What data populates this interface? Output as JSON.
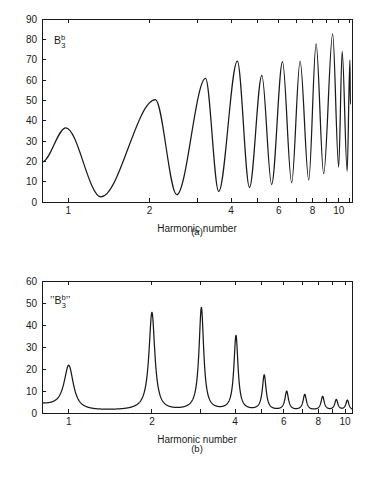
{
  "figure": {
    "background_color": "#ffffff",
    "ink_color": "#1a1a1a"
  },
  "chart_data": [
    {
      "type": "line",
      "panel": "a",
      "caption": "(a)",
      "title": "",
      "series_label": "B",
      "series_label_sup": "b",
      "series_label_sub": "3",
      "xlabel": "Harmonic number",
      "ylabel": "",
      "xscale": "log",
      "xlim": [
        0.8,
        11.2
      ],
      "ylim": [
        0,
        90
      ],
      "yticks": [
        0,
        10,
        20,
        30,
        40,
        50,
        60,
        70,
        80,
        90
      ],
      "xticks": [
        1,
        2,
        3,
        4,
        5,
        6,
        7,
        8,
        9,
        10,
        11
      ],
      "xticklabels": [
        "1",
        "2",
        "",
        "4",
        "",
        "6",
        "",
        "8",
        "",
        "10",
        ""
      ],
      "grid": false,
      "legend": "none",
      "line_color": "#1a1a1a",
      "peaks": [
        {
          "x": 0.98,
          "y": 36.5
        },
        {
          "x": 2.1,
          "y": 50.3
        },
        {
          "x": 3.22,
          "y": 60.8
        },
        {
          "x": 4.22,
          "y": 69.3
        },
        {
          "x": 5.2,
          "y": 62.3
        },
        {
          "x": 6.2,
          "y": 69.0
        },
        {
          "x": 7.2,
          "y": 69.3
        },
        {
          "x": 8.25,
          "y": 77.8
        },
        {
          "x": 9.5,
          "y": 82.7
        },
        {
          "x": 10.3,
          "y": 74.2
        },
        {
          "x": 11.0,
          "y": 69.8
        }
      ],
      "troughs": [
        {
          "x": 1.32,
          "y": 2.5
        },
        {
          "x": 2.52,
          "y": 3.6
        },
        {
          "x": 3.6,
          "y": 5.2
        },
        {
          "x": 4.68,
          "y": 7.1
        },
        {
          "x": 5.65,
          "y": 8.6
        },
        {
          "x": 6.7,
          "y": 9.4
        },
        {
          "x": 7.75,
          "y": 10.8
        },
        {
          "x": 8.8,
          "y": 13.9
        },
        {
          "x": 10.0,
          "y": 17.2
        },
        {
          "x": 10.75,
          "y": 15.1
        },
        {
          "x": 11.05,
          "y": 48.2
        }
      ],
      "start_point": {
        "x": 0.8,
        "y": 19.6
      }
    },
    {
      "type": "line",
      "panel": "b",
      "caption": "(b)",
      "title": "",
      "series_label": "B",
      "series_label_sup": "b",
      "series_label_sub": "3",
      "series_label_quoted": true,
      "xlabel": "Harmonic number",
      "ylabel": "",
      "xscale": "log",
      "xlim": [
        0.8,
        10.6
      ],
      "ylim": [
        0,
        60
      ],
      "yticks": [
        0,
        10,
        20,
        30,
        40,
        50,
        60
      ],
      "xticks": [
        1,
        2,
        3,
        4,
        5,
        6,
        7,
        8,
        9,
        10
      ],
      "xticklabels": [
        "1",
        "2",
        "",
        "4",
        "",
        "6",
        "",
        "8",
        "",
        "10"
      ],
      "grid": false,
      "legend": "none",
      "line_color": "#1a1a1a",
      "peaks": [
        {
          "x": 1.0,
          "y": 21.5
        },
        {
          "x": 2.0,
          "y": 45.5
        },
        {
          "x": 3.02,
          "y": 47.6
        },
        {
          "x": 4.03,
          "y": 34.9
        },
        {
          "x": 5.1,
          "y": 17.0
        },
        {
          "x": 6.15,
          "y": 9.6
        },
        {
          "x": 7.15,
          "y": 8.2
        },
        {
          "x": 8.3,
          "y": 7.3
        },
        {
          "x": 9.3,
          "y": 5.8
        },
        {
          "x": 10.2,
          "y": 5.6
        }
      ],
      "troughs": [
        {
          "x": 1.22,
          "y": 0.9
        },
        {
          "x": 2.35,
          "y": 1.1
        },
        {
          "x": 3.45,
          "y": 1.2
        },
        {
          "x": 4.55,
          "y": 1.3
        },
        {
          "x": 5.6,
          "y": 1.4
        },
        {
          "x": 6.65,
          "y": 1.5
        },
        {
          "x": 7.7,
          "y": 1.6
        },
        {
          "x": 8.8,
          "y": 1.7
        },
        {
          "x": 9.75,
          "y": 1.8
        },
        {
          "x": 10.5,
          "y": 1.6
        }
      ],
      "start_point": {
        "x": 0.8,
        "y": 4.2
      },
      "baseline": 1.0
    }
  ]
}
